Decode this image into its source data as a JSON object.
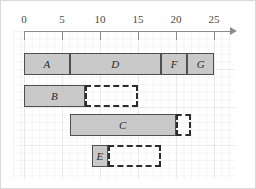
{
  "chart_data": {
    "type": "bar",
    "title": "",
    "xlabel": "",
    "ylabel": "",
    "xlim": [
      0,
      26.5
    ],
    "grid": true,
    "legend": "none",
    "orientation": "horizontal",
    "axis_arrow": true,
    "xticks": [
      0,
      5,
      10,
      15,
      20,
      25
    ],
    "xtick_labels": [
      "0",
      "5",
      "10",
      "15",
      "20",
      "25"
    ],
    "rows": [
      {
        "row": 1,
        "bars": [
          {
            "label": "A",
            "start": 0,
            "end": 6,
            "style": "solid"
          },
          {
            "label": "D",
            "start": 6,
            "end": 18,
            "style": "solid"
          },
          {
            "label": "F",
            "start": 18,
            "end": 21.5,
            "style": "solid"
          },
          {
            "label": "G",
            "start": 21.5,
            "end": 25,
            "style": "solid"
          }
        ]
      },
      {
        "row": 2,
        "bars": [
          {
            "label": "B",
            "start": 0,
            "end": 8,
            "style": "solid"
          },
          {
            "label": "",
            "start": 8,
            "end": 15,
            "style": "dashed"
          }
        ]
      },
      {
        "row": 3,
        "bars": [
          {
            "label": "C",
            "start": 6,
            "end": 20,
            "style": "solid"
          },
          {
            "label": "",
            "start": 20,
            "end": 22,
            "style": "dashed"
          }
        ]
      },
      {
        "row": 4,
        "bars": [
          {
            "label": "E",
            "start": 9,
            "end": 11,
            "style": "solid"
          },
          {
            "label": "",
            "start": 11,
            "end": 18,
            "style": "dashed"
          }
        ]
      }
    ]
  },
  "ticks": {
    "t0": "0",
    "t1": "5",
    "t2": "10",
    "t3": "15",
    "t4": "20",
    "t5": "25"
  },
  "labels": {
    "a": "A",
    "b": "B",
    "c": "C",
    "d": "D",
    "e": "E",
    "f": "F",
    "g": "G"
  },
  "colors": {
    "bar_fill": "#c9c9c9",
    "bar_stroke": "#4f4f4f",
    "dashed_stroke": "#2b2b2b",
    "grid_minor": "#f4f4f4",
    "grid_major": "#e9e9e9",
    "axis": "#8c8c8c",
    "frame": "#d9d9d9"
  }
}
